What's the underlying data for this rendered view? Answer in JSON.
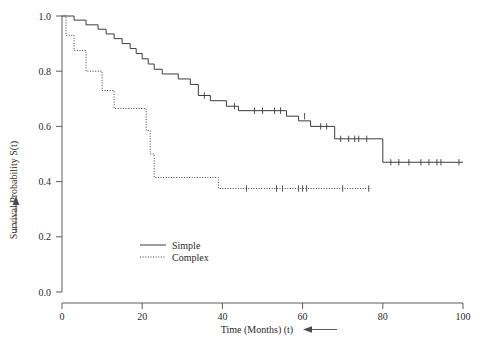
{
  "chart_data": {
    "type": "line",
    "title": "",
    "xlabel": "Time (Months) (t)",
    "ylabel": "Survival Probability S(t)",
    "xlim": [
      0,
      100
    ],
    "ylim": [
      0.0,
      1.0
    ],
    "grid": false,
    "legend_position": "inside-lower-left",
    "x_ticks": [
      0,
      20,
      40,
      60,
      80,
      100
    ],
    "x_tick_labels": [
      "0",
      "20",
      "40",
      "60",
      "80",
      "100"
    ],
    "y_ticks": [
      0.0,
      0.2,
      0.4,
      0.6,
      0.8,
      1.0
    ],
    "y_tick_labels": [
      "0.0",
      "0.2",
      "0.4",
      "0.6",
      "0.8",
      "1.0"
    ],
    "series": [
      {
        "name": "Simple",
        "linestyle": "solid",
        "color": "#3c3c3c",
        "steps": [
          [
            0,
            1.0
          ],
          [
            3,
            1.0
          ],
          [
            3,
            0.985
          ],
          [
            6,
            0.985
          ],
          [
            6,
            0.968
          ],
          [
            9,
            0.968
          ],
          [
            9,
            0.952
          ],
          [
            11,
            0.952
          ],
          [
            11,
            0.935
          ],
          [
            13,
            0.935
          ],
          [
            13,
            0.918
          ],
          [
            15,
            0.918
          ],
          [
            15,
            0.9
          ],
          [
            17,
            0.9
          ],
          [
            17,
            0.882
          ],
          [
            18.5,
            0.882
          ],
          [
            18.5,
            0.864
          ],
          [
            20,
            0.864
          ],
          [
            20,
            0.845
          ],
          [
            21.5,
            0.845
          ],
          [
            21.5,
            0.826
          ],
          [
            23,
            0.826
          ],
          [
            23,
            0.807
          ],
          [
            25,
            0.807
          ],
          [
            25,
            0.79
          ],
          [
            29,
            0.79
          ],
          [
            29,
            0.772
          ],
          [
            32,
            0.772
          ],
          [
            32,
            0.752
          ],
          [
            34,
            0.752
          ],
          [
            34,
            0.712
          ],
          [
            37,
            0.712
          ],
          [
            37,
            0.693
          ],
          [
            41,
            0.693
          ],
          [
            41,
            0.673
          ],
          [
            44,
            0.673
          ],
          [
            44,
            0.657
          ],
          [
            56,
            0.657
          ],
          [
            56,
            0.637
          ],
          [
            59,
            0.637
          ],
          [
            59,
            0.62
          ],
          [
            62,
            0.62
          ],
          [
            62,
            0.6
          ],
          [
            68,
            0.6
          ],
          [
            68,
            0.555
          ],
          [
            80,
            0.555
          ],
          [
            80,
            0.47
          ],
          [
            100,
            0.47
          ]
        ],
        "censor_points": [
          [
            35.5,
            0.712
          ],
          [
            43,
            0.673
          ],
          [
            48,
            0.657
          ],
          [
            50,
            0.657
          ],
          [
            53,
            0.657
          ],
          [
            54.5,
            0.657
          ],
          [
            60.5,
            0.637
          ],
          [
            64.5,
            0.6
          ],
          [
            66,
            0.6
          ],
          [
            69.5,
            0.555
          ],
          [
            71.5,
            0.555
          ],
          [
            73,
            0.555
          ],
          [
            74,
            0.555
          ],
          [
            76,
            0.555
          ],
          [
            82,
            0.47
          ],
          [
            84,
            0.47
          ],
          [
            86.5,
            0.47
          ],
          [
            89.5,
            0.47
          ],
          [
            91.5,
            0.47
          ],
          [
            93.5,
            0.47
          ],
          [
            94.5,
            0.47
          ],
          [
            99,
            0.47
          ]
        ]
      },
      {
        "name": "Complex",
        "linestyle": "dotted",
        "color": "#3c3c3c",
        "steps": [
          [
            0,
            1.0
          ],
          [
            1,
            1.0
          ],
          [
            1,
            0.93
          ],
          [
            3,
            0.93
          ],
          [
            3,
            0.875
          ],
          [
            6,
            0.875
          ],
          [
            6,
            0.8
          ],
          [
            10,
            0.8
          ],
          [
            10,
            0.73
          ],
          [
            13,
            0.73
          ],
          [
            13,
            0.665
          ],
          [
            21,
            0.665
          ],
          [
            21,
            0.585
          ],
          [
            22,
            0.585
          ],
          [
            22,
            0.5
          ],
          [
            23,
            0.5
          ],
          [
            23,
            0.415
          ],
          [
            39,
            0.415
          ],
          [
            39,
            0.375
          ],
          [
            77,
            0.375
          ]
        ],
        "censor_points": [
          [
            46,
            0.375
          ],
          [
            53.5,
            0.375
          ],
          [
            55,
            0.375
          ],
          [
            59,
            0.375
          ],
          [
            60,
            0.375
          ],
          [
            61,
            0.375
          ],
          [
            70,
            0.375
          ],
          [
            76.5,
            0.375
          ]
        ]
      }
    ],
    "annotations": [
      {
        "name": "x-axis-arrow",
        "direction": "left",
        "near": "Time (Months) (t)"
      },
      {
        "name": "y-axis-arrow",
        "direction": "up",
        "near": "Survival Probability S(t)"
      }
    ]
  },
  "legend": {
    "entries": [
      {
        "label": "Simple",
        "style": "solid"
      },
      {
        "label": "Complex",
        "style": "dotted"
      }
    ]
  },
  "colors": {
    "line": "#3c3c3c",
    "axis": "#4a4a4a",
    "text": "#2a2a2a",
    "background": "#ffffff"
  }
}
